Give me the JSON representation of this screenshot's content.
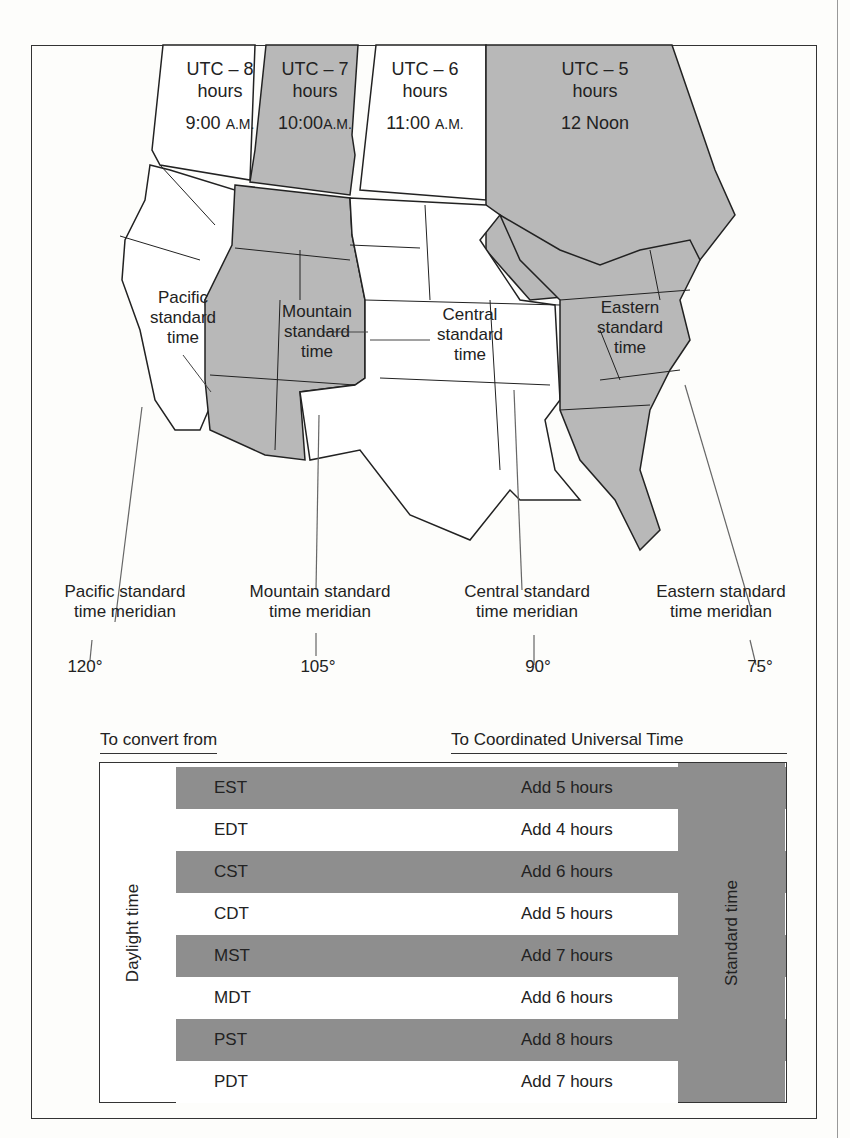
{
  "zones": [
    {
      "offset": "UTC – 8",
      "unit": "hours",
      "time": "9:00",
      "suffix": "A.M.",
      "shaded": false
    },
    {
      "offset": "UTC – 7",
      "unit": "hours",
      "time": "10:00",
      "suffix": "A.M.",
      "shaded": true
    },
    {
      "offset": "UTC – 6",
      "unit": "hours",
      "time": "11:00",
      "suffix": "A.M.",
      "shaded": false
    },
    {
      "offset": "UTC – 5",
      "unit": "hours",
      "time": "12 Noon",
      "suffix": "",
      "shaded": true
    }
  ],
  "region_labels": {
    "pacific": [
      "Pacific",
      "standard",
      "time"
    ],
    "mountain": [
      "Mountain",
      "standard",
      "time"
    ],
    "central": [
      "Central",
      "standard",
      "time"
    ],
    "eastern": [
      "Eastern",
      "standard",
      "time"
    ]
  },
  "meridians": [
    {
      "line1": "Pacific standard",
      "line2": "time meridian",
      "degrees": "120°"
    },
    {
      "line1": "Mountain standard",
      "line2": "time meridian",
      "degrees": "105°"
    },
    {
      "line1": "Central standard",
      "line2": "time meridian",
      "degrees": "90°"
    },
    {
      "line1": "Eastern standard",
      "line2": "time meridian",
      "degrees": "75°"
    }
  ],
  "table": {
    "header_from": "To convert from",
    "header_to": "To Coordinated Universal Time",
    "daylight_label": "Daylight time",
    "standard_label": "Standard time",
    "rows": [
      {
        "code": "EST",
        "action": "Add 5 hours",
        "type": "standard"
      },
      {
        "code": "EDT",
        "action": "Add 4 hours",
        "type": "daylight"
      },
      {
        "code": "CST",
        "action": "Add 6 hours",
        "type": "standard"
      },
      {
        "code": "CDT",
        "action": "Add 5 hours",
        "type": "daylight"
      },
      {
        "code": "MST",
        "action": "Add 7 hours",
        "type": "standard"
      },
      {
        "code": "MDT",
        "action": "Add 6 hours",
        "type": "daylight"
      },
      {
        "code": "PST",
        "action": "Add 8 hours",
        "type": "standard"
      },
      {
        "code": "PDT",
        "action": "Add 7 hours",
        "type": "daylight"
      }
    ]
  },
  "colors": {
    "shade": "#b8b8b8",
    "table_shade": "#8e8e8e",
    "ink": "#222222"
  }
}
